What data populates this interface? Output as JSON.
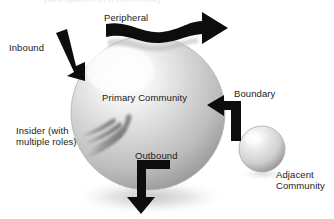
{
  "figure": {
    "type": "conceptual-diagram",
    "background_color": "#ffffff",
    "text_color": "#1a1a1a",
    "arrow_color": "#0d0d0d",
    "sphere_color_light": "#fbfbfb",
    "sphere_color_mid": "#c9c9c9",
    "sphere_color_dark": "#8e8e8e",
    "clipped_header_text": "participation in a community"
  },
  "labels": {
    "peripheral": "Peripheral",
    "inbound": "Inbound",
    "primary_community": "Primary Community",
    "insider": "Insider (with\nmultiple roles)",
    "outbound": "Outbound",
    "boundary": "Boundary",
    "adjacent_community": "Adjacent\nCommunity"
  },
  "shapes": {
    "primary_sphere": {
      "name": "Primary Community",
      "cx": 148,
      "cy": 113,
      "r": 77
    },
    "adjacent_sphere": {
      "name": "Adjacent Community",
      "cx": 262,
      "cy": 149,
      "r": 23
    },
    "insider_spiral": {
      "name": "Insider with multiple roles",
      "arcs": 4
    }
  },
  "arrows": [
    {
      "id": "peripheral",
      "label": "Peripheral",
      "style": "wavy",
      "direction": "left-to-right",
      "meaning": "passes along the periphery without entering"
    },
    {
      "id": "inbound",
      "label": "Inbound",
      "style": "elbow",
      "direction": "down-right",
      "meaning": "enters the primary community"
    },
    {
      "id": "outbound",
      "label": "Outbound",
      "style": "elbow",
      "direction": "down",
      "meaning": "leaves the primary community"
    },
    {
      "id": "boundary",
      "label": "Boundary",
      "style": "elbow",
      "direction": "left",
      "meaning": "points at the edge of the primary community"
    }
  ]
}
